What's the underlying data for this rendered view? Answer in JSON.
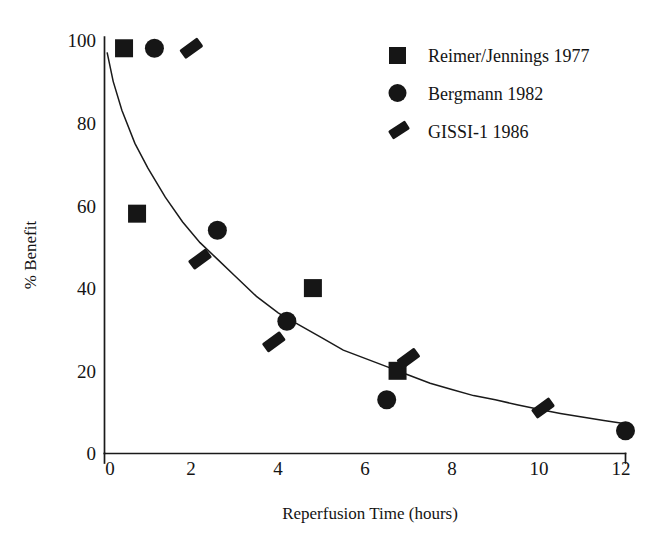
{
  "chart_data": {
    "type": "scatter",
    "title": "",
    "xlabel": "Reperfusion Time (hours)",
    "ylabel": "% Benefit",
    "xlim": [
      0,
      12
    ],
    "ylim": [
      0,
      100
    ],
    "xticks": [
      0,
      2,
      4,
      6,
      8,
      10,
      12
    ],
    "yticks": [
      0,
      20,
      40,
      60,
      80,
      100
    ],
    "xtick_labels": [
      "0",
      "2",
      "4",
      "6",
      "8",
      "10",
      "12"
    ],
    "ytick_labels": [
      "0",
      "20",
      "40",
      "60",
      "80",
      "100"
    ],
    "grid": false,
    "legend_position": "top-right",
    "series": [
      {
        "name": "Reimer/Jennings 1977",
        "marker": "square",
        "color": "#161616",
        "points": [
          {
            "x": 0.45,
            "y": 98
          },
          {
            "x": 0.75,
            "y": 58
          },
          {
            "x": 4.8,
            "y": 40
          },
          {
            "x": 6.75,
            "y": 20
          }
        ]
      },
      {
        "name": "Bergmann 1982",
        "marker": "circle",
        "color": "#161616",
        "points": [
          {
            "x": 1.15,
            "y": 98
          },
          {
            "x": 2.6,
            "y": 54
          },
          {
            "x": 4.2,
            "y": 32
          },
          {
            "x": 6.5,
            "y": 13
          },
          {
            "x": 12.0,
            "y": 5.5
          }
        ]
      },
      {
        "name": "GISSI-1 1986",
        "marker": "slash",
        "color": "#161616",
        "points": [
          {
            "x": 2.0,
            "y": 98
          },
          {
            "x": 2.2,
            "y": 47
          },
          {
            "x": 3.9,
            "y": 27
          },
          {
            "x": 7.0,
            "y": 23
          },
          {
            "x": 10.1,
            "y": 11
          }
        ]
      }
    ],
    "fit_curve": {
      "description": "exponential decay trend line",
      "points": [
        {
          "x": 0.06,
          "y": 97
        },
        {
          "x": 0.2,
          "y": 90
        },
        {
          "x": 0.4,
          "y": 83
        },
        {
          "x": 0.7,
          "y": 75
        },
        {
          "x": 1.0,
          "y": 69
        },
        {
          "x": 1.4,
          "y": 62
        },
        {
          "x": 1.8,
          "y": 56
        },
        {
          "x": 2.2,
          "y": 51
        },
        {
          "x": 2.6,
          "y": 47
        },
        {
          "x": 3.0,
          "y": 43
        },
        {
          "x": 3.5,
          "y": 38
        },
        {
          "x": 4.0,
          "y": 34
        },
        {
          "x": 4.5,
          "y": 31
        },
        {
          "x": 5.0,
          "y": 28
        },
        {
          "x": 5.5,
          "y": 25
        },
        {
          "x": 6.0,
          "y": 23
        },
        {
          "x": 6.5,
          "y": 21
        },
        {
          "x": 7.0,
          "y": 19
        },
        {
          "x": 7.5,
          "y": 17
        },
        {
          "x": 8.0,
          "y": 15.5
        },
        {
          "x": 8.5,
          "y": 14
        },
        {
          "x": 9.0,
          "y": 13
        },
        {
          "x": 9.5,
          "y": 11.8
        },
        {
          "x": 10.0,
          "y": 10.7
        },
        {
          "x": 10.5,
          "y": 9.7
        },
        {
          "x": 11.0,
          "y": 8.8
        },
        {
          "x": 11.5,
          "y": 8.0
        },
        {
          "x": 12.0,
          "y": 7.2
        }
      ]
    }
  },
  "legend": {
    "entries": [
      {
        "label": "Reimer/Jennings 1977",
        "marker": "square"
      },
      {
        "label": "Bergmann 1982",
        "marker": "circle"
      },
      {
        "label": "GISSI-1 1986",
        "marker": "slash"
      }
    ]
  }
}
